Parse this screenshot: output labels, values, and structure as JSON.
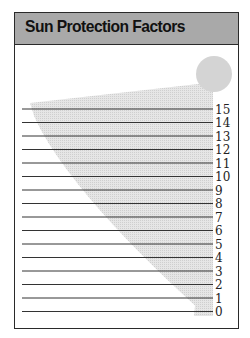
{
  "header": {
    "title": "Sun Protection Factors"
  },
  "colors": {
    "header_bg": "#a9a9a9",
    "sun": "#d4d4d4",
    "rays": "#dcdcdc",
    "lines": "#333333",
    "frame": "#2a2a2a"
  },
  "chart_data": {
    "type": "diagram",
    "title": "Sun Protection Factors",
    "scale_labels": [
      "15",
      "14",
      "13",
      "12",
      "11",
      "10",
      "9",
      "8",
      "7",
      "6",
      "5",
      "4",
      "3",
      "2",
      "1",
      "0"
    ]
  },
  "scale": {
    "labels": [
      "15",
      "14",
      "13",
      "12",
      "11",
      "10",
      "9",
      "8",
      "7",
      "6",
      "5",
      "4",
      "3",
      "2",
      "1",
      "0"
    ]
  }
}
